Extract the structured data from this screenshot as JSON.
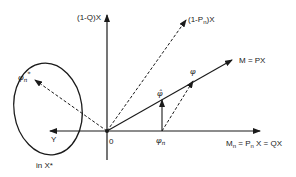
{
  "diagram": {
    "type": "vector-space-decomposition",
    "origin_label": "0",
    "axes": {
      "vertical": {
        "label": "(1-Q)X"
      },
      "horizontal": {
        "label_main": "M",
        "label_sub": "n",
        "label_rest1": " = P",
        "label_sub2": "n",
        "label_rest2": " X = QX"
      },
      "left": {
        "label": "Y"
      }
    },
    "vectors": {
      "dashed_complement": {
        "label_pre": "(1-P",
        "label_sub": "n",
        "label_post": ")X"
      },
      "solid_m": {
        "label": "M = PX"
      }
    },
    "points": {
      "phi": "φ",
      "phi_hat": "φ̂",
      "phi_n_main": "φ",
      "phi_n_sub": "n",
      "phi_n_star_main": "φ",
      "phi_n_star_sub": "n",
      "phi_n_star_sup": "*"
    },
    "ellipse": {
      "label": "in X*"
    },
    "colors": {
      "stroke": "#1a1a1a",
      "background": "#ffffff"
    }
  }
}
